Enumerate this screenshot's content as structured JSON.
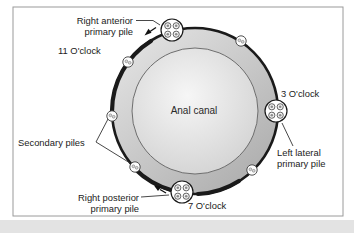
{
  "diagram": {
    "center_label": "Anal canal",
    "labels": {
      "right_anterior_line1": "Right anterior",
      "right_anterior_line2": "primary pile",
      "clock_11": "11 O'clock",
      "clock_3": "3 O'clock",
      "left_lateral_line1": "Left lateral",
      "left_lateral_line2": "primary pile",
      "secondary_piles": "Secondary piles",
      "right_posterior_line1": "Right posterior",
      "right_posterior_line2": "primary pile",
      "clock_7": "7 O'clock"
    },
    "counts": {
      "primary_piles": 3,
      "secondary_piles": 5
    }
  },
  "colors": {
    "outline": "#1a1a1a",
    "ring_light": "#e8e8e8",
    "ring_dark": "#acacac",
    "inner_light": "#f6f6f6",
    "inner_dark": "#cfcfcf",
    "inner_stroke": "#6e6e6e",
    "frame_border": "#9a9a9a",
    "label_text": "#222222",
    "pointer_line": "#333333",
    "page_strip": "#e3e3e3"
  }
}
